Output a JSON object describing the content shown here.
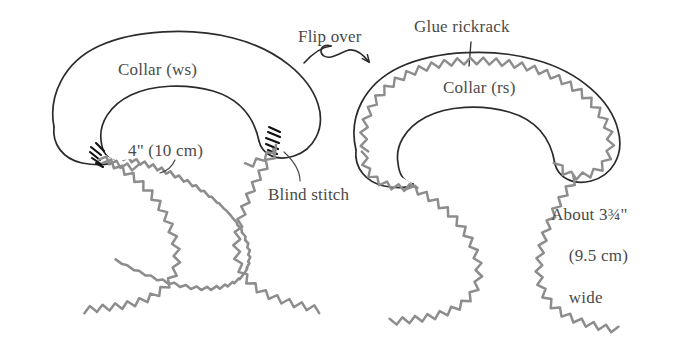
{
  "diagram": {
    "background_color": "#ffffff",
    "ink_color": "#2b2b2b",
    "rickrack_color": "#8d8d8d",
    "text_color": "#4a4a4a"
  },
  "labels": {
    "collar_ws": "Collar (ws)",
    "collar_rs": "Collar (rs)",
    "flip_over": "Flip over",
    "glue_rickrack": "Glue rickrack",
    "four_inch": "4\" (10 cm)",
    "blind_stitch": "Blind stitch",
    "about_width_line1": "About 3¾\"",
    "about_width_line2": "(9.5 cm)",
    "about_width_line3": "wide"
  },
  "measurements": {
    "inner_opening_inches": "4\"",
    "inner_opening_cm": "10 cm",
    "collar_width_inches": "3¾\"",
    "collar_width_cm": "9.5 cm"
  },
  "figures": [
    {
      "id": "left-collar",
      "side": "wrong side",
      "label": "Collar (ws)",
      "has_rickrack_trim": false,
      "has_blind_stitch_marks": true,
      "rickrack_tails": 2
    },
    {
      "id": "right-collar",
      "side": "right side",
      "label": "Collar (rs)",
      "has_rickrack_trim": true,
      "has_blind_stitch_marks": false,
      "rickrack_tails": 2
    }
  ],
  "annotations": [
    {
      "name": "flip-over-arrow",
      "text": "Flip over",
      "points_to": "right-collar"
    },
    {
      "name": "glue-rickrack-leader",
      "text": "Glue rickrack",
      "points_to": "right-collar-outer-edge"
    },
    {
      "name": "blind-stitch-leader",
      "text": "Blind stitch",
      "points_to": "left-collar-stitch-marks"
    },
    {
      "name": "four-inch-leader",
      "text": "4\" (10 cm)",
      "points_to": "left-collar-inner-opening"
    },
    {
      "name": "about-width-note",
      "text": "About 3¾\" (9.5 cm) wide",
      "points_to": "right-collar-band-width"
    }
  ]
}
